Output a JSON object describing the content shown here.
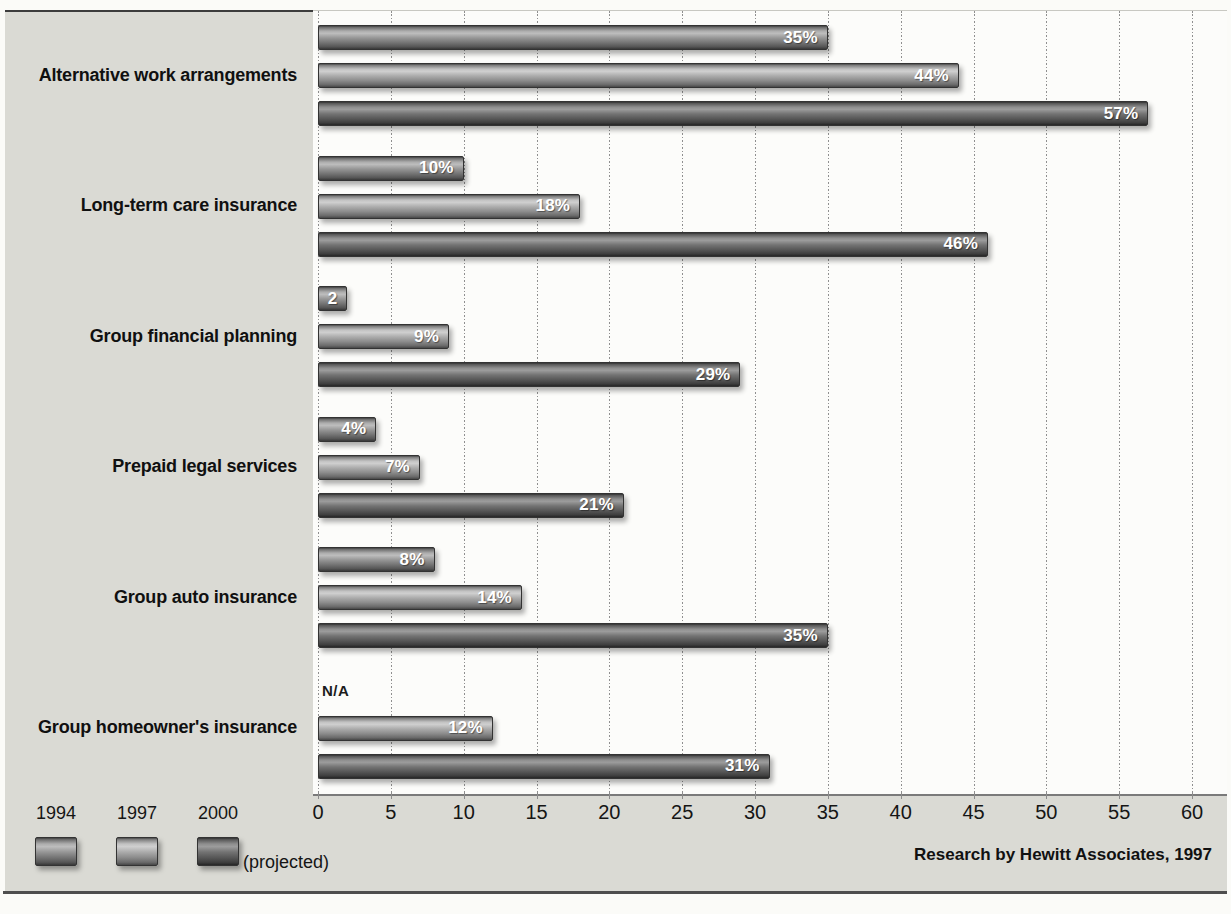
{
  "chart_data": {
    "type": "bar",
    "orientation": "horizontal",
    "categories": [
      "Alternative work arrangements",
      "Long-term care insurance",
      "Group financial planning",
      "Prepaid legal services",
      "Group auto insurance",
      "Group homeowner's insurance"
    ],
    "series": [
      {
        "name": "1994",
        "values": [
          35,
          10,
          2,
          4,
          8,
          null
        ],
        "display_labels": [
          "35%",
          "10%",
          "2",
          "4%",
          "8%",
          "N/A"
        ]
      },
      {
        "name": "1997",
        "values": [
          44,
          18,
          9,
          7,
          14,
          12
        ],
        "display_labels": [
          "44%",
          "18%",
          "9%",
          "7%",
          "14%",
          "12%"
        ]
      },
      {
        "name": "2000",
        "note": "(projected)",
        "values": [
          57,
          46,
          29,
          21,
          35,
          31
        ],
        "display_labels": [
          "57%",
          "46%",
          "29%",
          "21%",
          "35%",
          "31%"
        ]
      }
    ],
    "xlim": [
      0,
      60
    ],
    "xticks": [
      0,
      5,
      10,
      15,
      20,
      25,
      30,
      35,
      40,
      45,
      50,
      55,
      60
    ],
    "grid": "vertical",
    "legend_position": "bottom-left",
    "source": "Research by Hewitt Associates, 1997"
  },
  "legend": {
    "items": [
      {
        "label": "1994"
      },
      {
        "label": "1997"
      },
      {
        "label": "2000"
      }
    ],
    "note": "(projected)"
  },
  "colors": {
    "panel_bg": "#dadad4",
    "plot_bg": "#fcfcfa",
    "gridline": "#8f8f8f",
    "bar_1994_mid": "#969696",
    "bar_1997_mid": "#ababab",
    "bar_2000_mid": "#737373",
    "value_text": "#ffffff",
    "label_text": "#101010"
  }
}
